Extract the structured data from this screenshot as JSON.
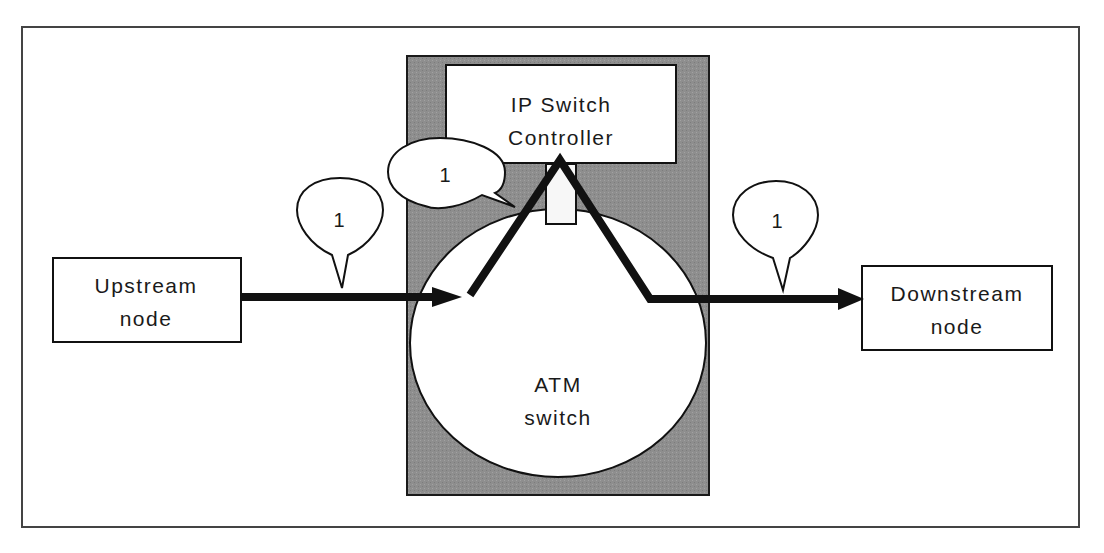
{
  "diagram": {
    "type": "network-flow",
    "colors": {
      "background": "#ffffff",
      "frame": "#444444",
      "switch_housing": "#8c8c8c",
      "line": "#111111",
      "box_fill": "#ffffff"
    },
    "nodes": {
      "upstream": {
        "line1": "Upstream",
        "line2": "node"
      },
      "downstream": {
        "line1": "Downstream",
        "line2": "node"
      },
      "controller": {
        "line1": "IP Switch",
        "line2": "Controller"
      },
      "atm_switch": {
        "line1": "ATM",
        "line2": "switch"
      }
    },
    "callouts": {
      "upstream_link": "1",
      "controller_link": "1",
      "downstream_link": "1"
    },
    "edges": [
      {
        "from": "Upstream node",
        "to": "ATM switch",
        "label": "1"
      },
      {
        "from": "ATM switch",
        "to": "IP Switch Controller",
        "label": "1"
      },
      {
        "from": "IP Switch Controller",
        "to": "ATM switch",
        "label": ""
      },
      {
        "from": "ATM switch",
        "to": "Downstream node",
        "label": "1"
      }
    ]
  }
}
